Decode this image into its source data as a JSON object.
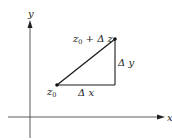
{
  "diagram": {
    "axes": {
      "x_label": "x",
      "y_label": "y"
    },
    "points": [
      {
        "id": "z0",
        "label_base": "z",
        "label_sub": "0",
        "label_suffix": ""
      },
      {
        "id": "z0_plus_dz",
        "label_base": "z",
        "label_sub": "0",
        "label_suffix": " + Δ z"
      }
    ],
    "segments": {
      "horizontal_label": "Δ x",
      "vertical_label": "Δ y"
    },
    "colors": {
      "line": "#1a1a1a",
      "axis": "#333333",
      "text": "#222222",
      "background": "#ffffff"
    }
  }
}
